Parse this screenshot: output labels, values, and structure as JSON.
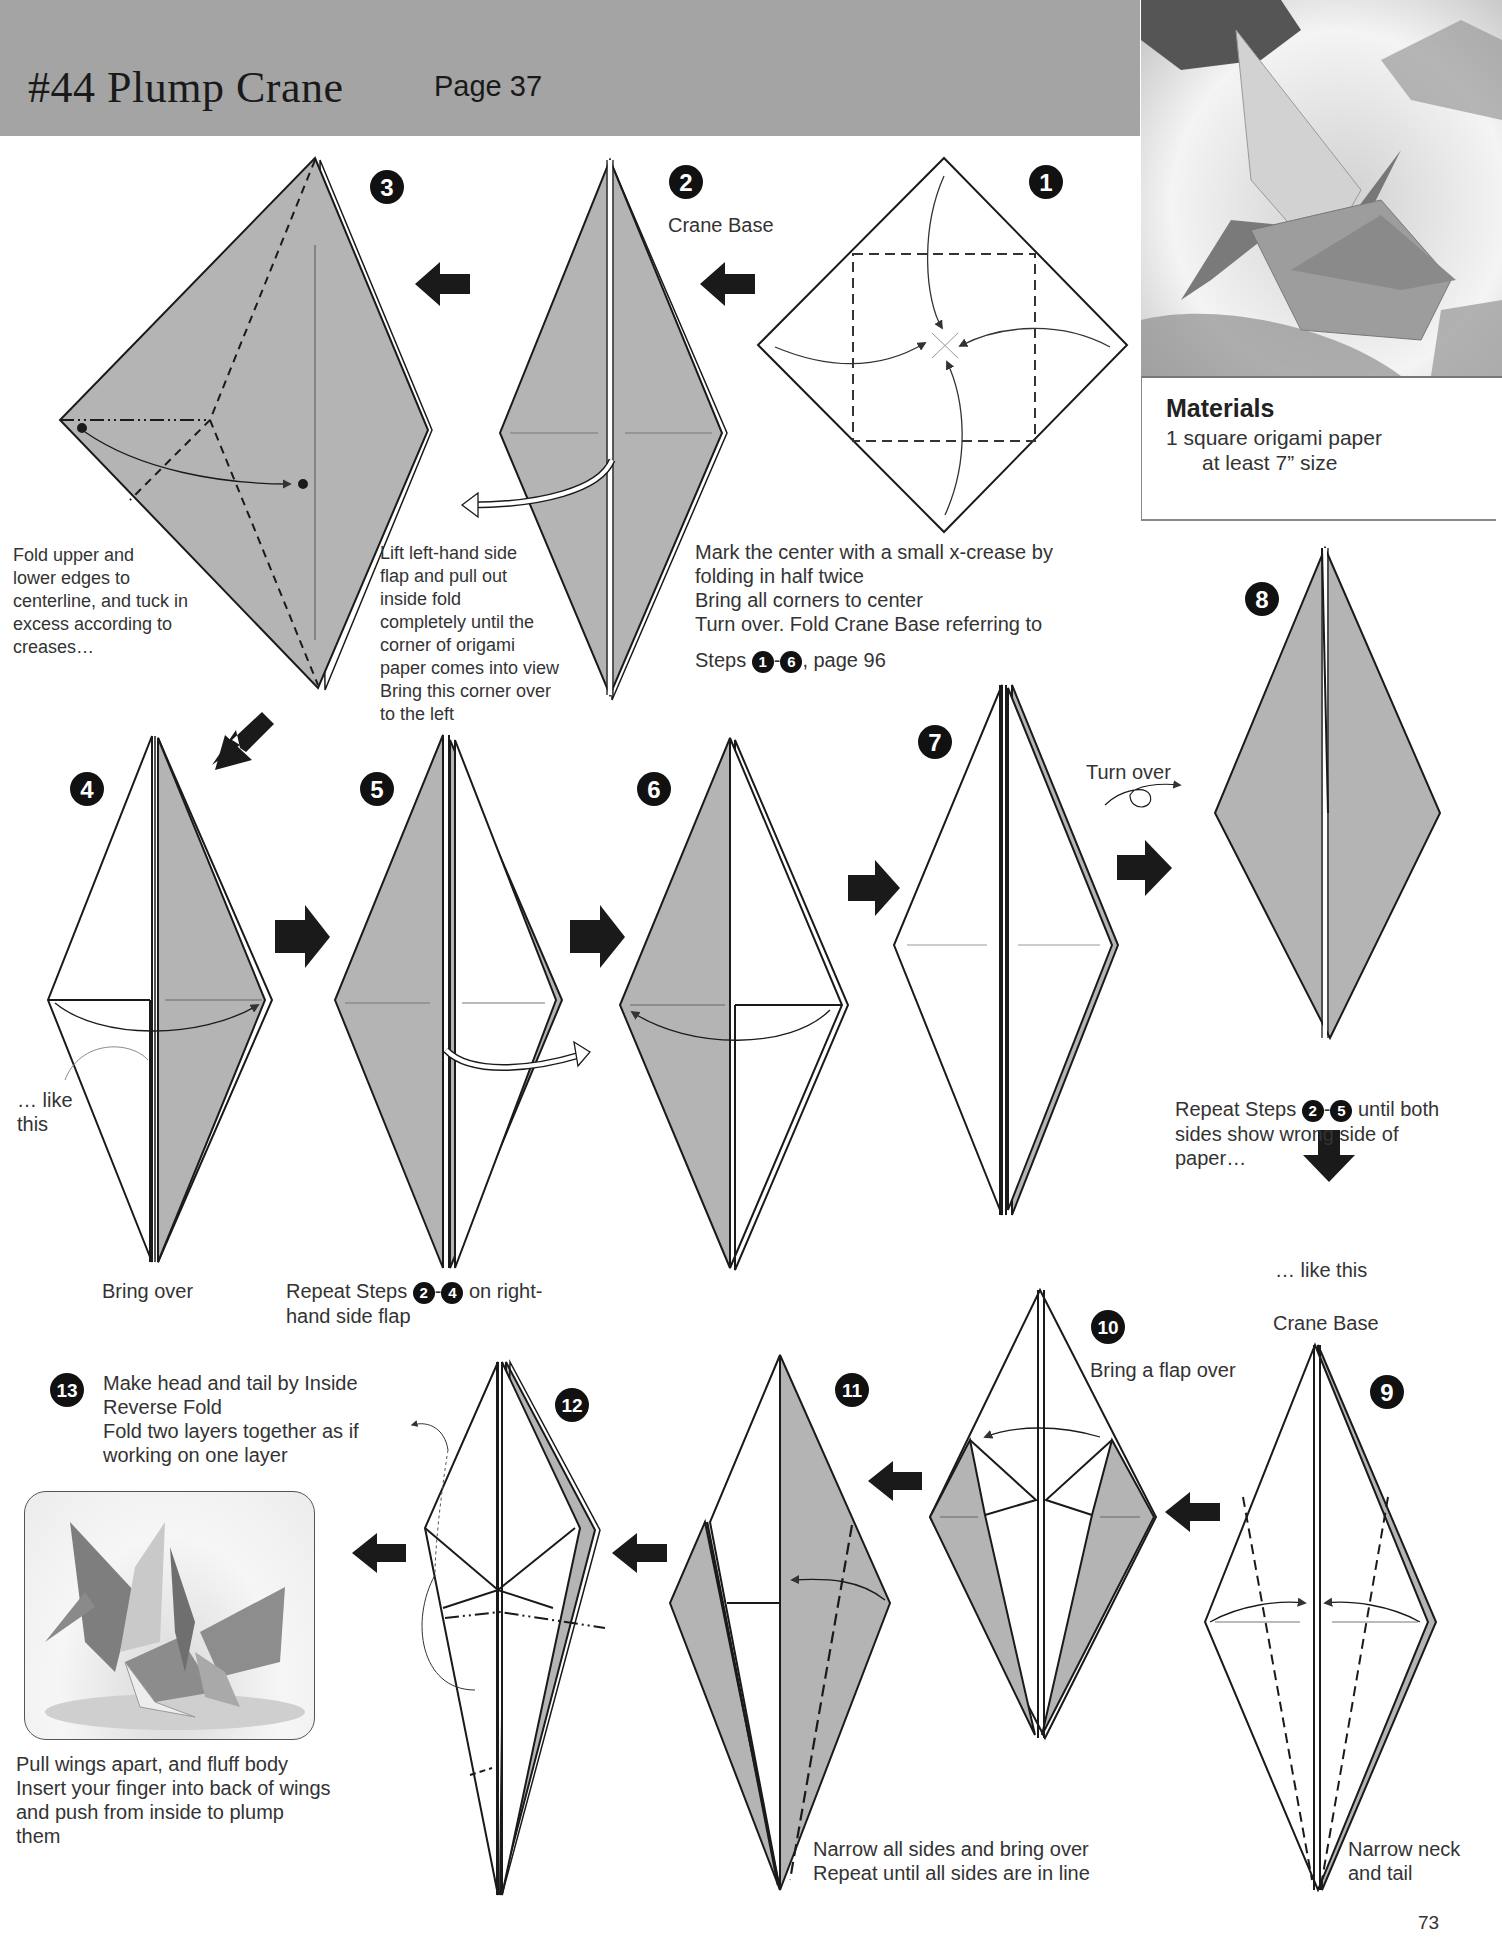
{
  "header": {
    "title": "#44 Plump Crane",
    "page_ref": "Page 37"
  },
  "materials": {
    "title": "Materials",
    "line1": "1  square origami paper",
    "line2": "at least 7” size"
  },
  "steps": {
    "s1": {
      "num": "1",
      "text_a": "Mark the center with a small x-crease by\nfolding in half twice\nBring all corners to center\nTurn over. Fold Crane Base referring to",
      "text_b_prefix": "Steps ",
      "ref_a": "1",
      "dash": "-",
      "ref_b": "6",
      "text_b_suffix": ", page 96"
    },
    "s2": {
      "num": "2",
      "label": "Crane Base",
      "text": "Lift left-hand side\nflap and pull out\ninside fold\ncompletely until the\ncorner of origami\npaper comes into view\nBring this corner over\nto the left"
    },
    "s3": {
      "num": "3",
      "text": "Fold upper and\nlower edges to\ncenterline, and tuck in\nexcess according to\ncreases…"
    },
    "s4": {
      "num": "4",
      "note": "… like\nthis",
      "caption": "Bring over"
    },
    "s5": {
      "num": "5",
      "caption_prefix": "Repeat Steps ",
      "ref_a": "2",
      "dash": "-",
      "ref_b": "4",
      "caption_suffix": " on right-\nhand side flap"
    },
    "s6": {
      "num": "6"
    },
    "s7": {
      "num": "7",
      "turn_over": "Turn over"
    },
    "s8": {
      "num": "8",
      "text_prefix": "Repeat Steps ",
      "ref_a": "2",
      "dash": "-",
      "ref_b": "5",
      "text_suffix": " until both\nsides show wrong side of\npaper…",
      "like_this": "… like this",
      "crane_base": "Crane Base"
    },
    "s9": {
      "num": "9",
      "text": "Narrow neck\nand tail"
    },
    "s10": {
      "num": "10",
      "text": "Bring a flap over"
    },
    "s11": {
      "num": "11",
      "text": "Narrow all sides and bring over\nRepeat until all sides are in line"
    },
    "s12": {
      "num": "12"
    },
    "s13": {
      "num": "13",
      "text": "Make head and tail by Inside\nReverse Fold\nFold two layers together as if\nworking on one layer",
      "final_text": "Pull wings apart, and fluff body\nInsert your finger into back of wings\nand push from inside to plump\nthem"
    }
  },
  "page_number": "73",
  "colors": {
    "header_bg": "#a4a4a4",
    "paper_color": "#b4b4b4",
    "ink": "#1a1a1a"
  }
}
